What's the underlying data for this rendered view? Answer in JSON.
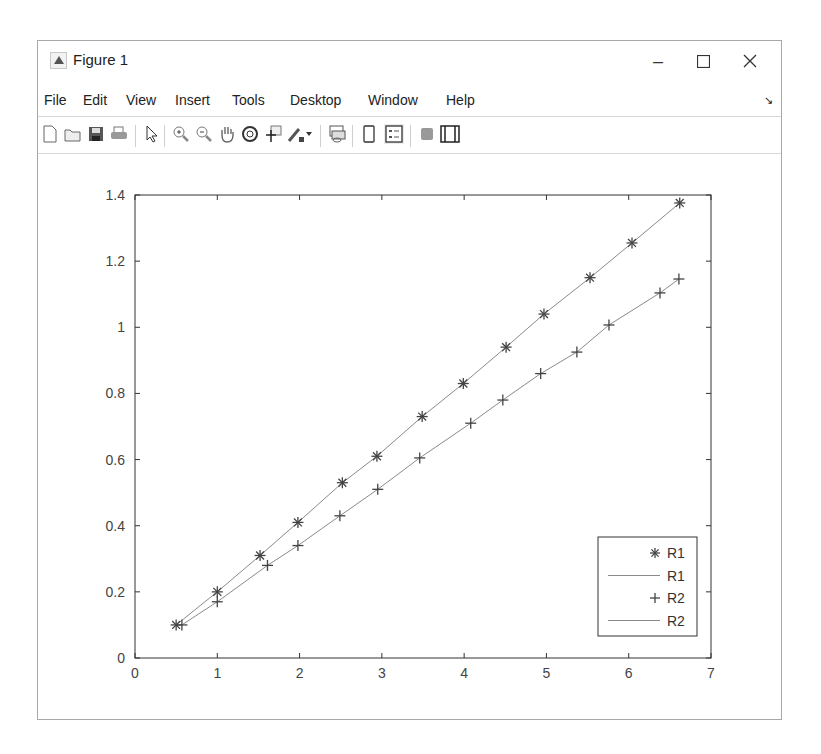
{
  "window": {
    "title": "Figure 1",
    "controls": {
      "minimize": "–",
      "maximize": "☐",
      "close": "✕"
    }
  },
  "menubar": {
    "items": [
      {
        "label": "File"
      },
      {
        "label": "Edit"
      },
      {
        "label": "View"
      },
      {
        "label": "Insert"
      },
      {
        "label": "Tools"
      },
      {
        "label": "Desktop"
      },
      {
        "label": "Window"
      },
      {
        "label": "Help"
      }
    ],
    "dock_arrow": "↘"
  },
  "toolbar": {
    "buttons": [
      {
        "icon": "new-figure-icon"
      },
      {
        "icon": "open-file-icon"
      },
      {
        "icon": "save-icon"
      },
      {
        "icon": "print-icon"
      },
      {
        "icon": "pointer-icon"
      },
      {
        "icon": "zoom-in-icon"
      },
      {
        "icon": "zoom-out-icon"
      },
      {
        "icon": "pan-hand-icon"
      },
      {
        "icon": "rotate-3d-icon"
      },
      {
        "icon": "data-cursor-icon"
      },
      {
        "icon": "brush-icon"
      },
      {
        "icon": "link-plot-icon"
      },
      {
        "icon": "colorbar-icon"
      },
      {
        "icon": "legend-icon"
      },
      {
        "icon": "hide-plot-tools-icon"
      },
      {
        "icon": "show-plot-tools-icon"
      }
    ]
  },
  "colors": {
    "axis": "#333333",
    "tick_label": "#444444",
    "series_line": "#8a8a8a",
    "marker": "#444444"
  },
  "chart_data": {
    "type": "line",
    "title": "",
    "xlabel": "",
    "ylabel": "",
    "xlim": [
      0,
      7
    ],
    "ylim": [
      0,
      1.4
    ],
    "xticks": [
      0,
      1,
      2,
      3,
      4,
      5,
      6,
      7
    ],
    "xtick_labels": [
      "0",
      "1",
      "2",
      "3",
      "4",
      "5",
      "6",
      "7"
    ],
    "yticks": [
      0,
      0.2,
      0.4,
      0.6,
      0.8,
      1.0,
      1.2,
      1.4
    ],
    "ytick_labels": [
      "0",
      "0.2",
      "0.4",
      "0.6",
      "0.8",
      "1",
      "1.2",
      "1.4"
    ],
    "grid": false,
    "legend_position": "southeast",
    "legend": [
      {
        "label": "R1",
        "style": "marker",
        "marker": "*"
      },
      {
        "label": "R1",
        "style": "line"
      },
      {
        "label": "R2",
        "style": "marker",
        "marker": "+"
      },
      {
        "label": "R2",
        "style": "line"
      }
    ],
    "series": [
      {
        "name": "R1",
        "marker": "*",
        "x": [
          0.5,
          1.0,
          1.52,
          1.98,
          2.52,
          2.94,
          3.49,
          3.99,
          4.51,
          4.97,
          5.53,
          6.04,
          6.62
        ],
        "y": [
          0.1,
          0.2,
          0.31,
          0.41,
          0.53,
          0.61,
          0.73,
          0.83,
          0.94,
          1.04,
          1.15,
          1.255,
          1.376
        ]
      },
      {
        "name": "R2",
        "marker": "+",
        "x": [
          0.57,
          1.0,
          1.61,
          1.98,
          2.49,
          2.95,
          3.46,
          4.08,
          4.47,
          4.93,
          5.37,
          5.76,
          6.38,
          6.61
        ],
        "y": [
          0.1,
          0.17,
          0.28,
          0.34,
          0.43,
          0.51,
          0.605,
          0.71,
          0.78,
          0.86,
          0.925,
          1.007,
          1.104,
          1.146
        ]
      }
    ]
  }
}
